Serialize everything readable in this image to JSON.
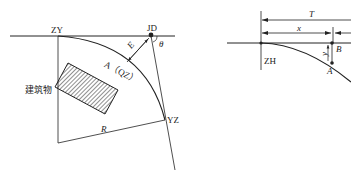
{
  "left_figure": {
    "labels": {
      "zy": "ZY",
      "jd": "JD",
      "theta": "θ",
      "e": "E",
      "a_qz": "A（QZ）",
      "building": "建筑物",
      "r": "R",
      "yz": "YZ"
    }
  },
  "right_figure": {
    "labels": {
      "t": "T",
      "x": "x",
      "y": "y",
      "b": "B",
      "a": "A",
      "zh": "ZH"
    }
  },
  "colors": {
    "line": "#222222",
    "background": "#ffffff"
  }
}
